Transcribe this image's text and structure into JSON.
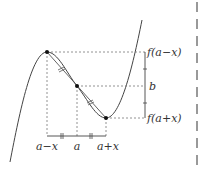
{
  "diagram": {
    "labels": {
      "f_minus": "f(a−x)",
      "b": "b",
      "f_plus": "f(a+x)",
      "x_minus": "a−x",
      "x_mid": "a",
      "x_plus": "a+x"
    },
    "points": [
      {
        "name": "peak",
        "x": 47,
        "y": 52
      },
      {
        "name": "inflection",
        "x": 77,
        "y": 86
      },
      {
        "name": "minimum",
        "x": 106,
        "y": 118
      }
    ],
    "colors": {
      "curve": "#444444",
      "dashed": "#777777",
      "side_dash": "#999999",
      "point": "#111111"
    }
  }
}
